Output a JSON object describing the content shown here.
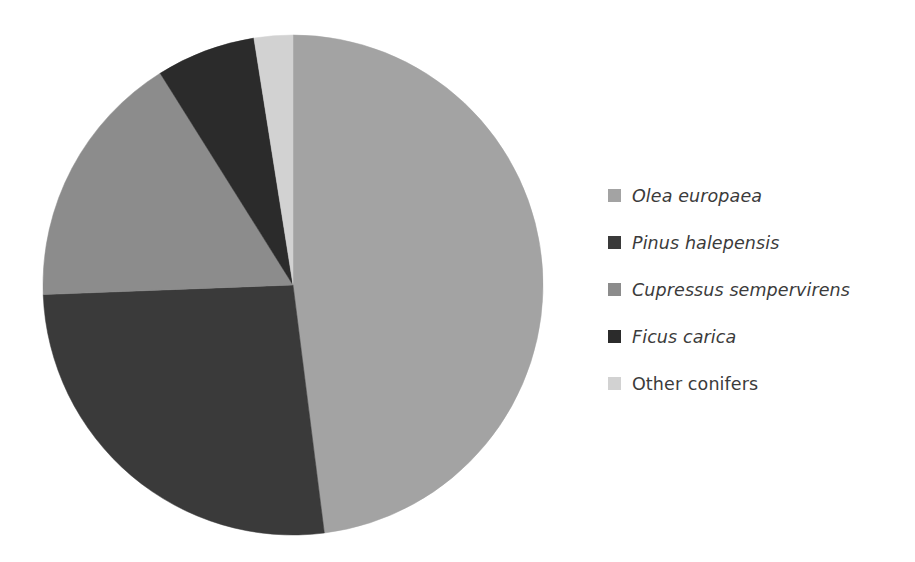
{
  "chart_data": {
    "type": "pie",
    "title": "",
    "subtitle": "",
    "xlabel": "",
    "ylabel": "",
    "grid": false,
    "legend_position": "right",
    "start_angle_deg": 0,
    "direction": "clockwise",
    "categories": [
      "Olea europaea",
      "Pinus halepensis",
      "Cupressus sempervirens",
      "Ficus carica",
      "Other conifers"
    ],
    "values": [
      48.0,
      26.4,
      16.7,
      6.4,
      2.5
    ],
    "unit": "%",
    "colors": [
      "#a3a3a3",
      "#3a3a3a",
      "#8c8c8c",
      "#2b2b2b",
      "#d2d2d2"
    ],
    "slices": [
      {
        "label": "Olea europaea",
        "value": 48.0,
        "color": "#a3a3a3",
        "start_angle_deg": 0,
        "end_angle_deg": 172.8,
        "italic": true
      },
      {
        "label": "Pinus halepensis",
        "value": 26.4,
        "color": "#3a3a3a",
        "start_angle_deg": 172.8,
        "end_angle_deg": 267.8,
        "italic": true
      },
      {
        "label": "Cupressus sempervirens",
        "value": 16.7,
        "color": "#8c8c8c",
        "start_angle_deg": 267.8,
        "end_angle_deg": 327.9,
        "italic": true
      },
      {
        "label": "Ficus carica",
        "value": 6.4,
        "color": "#2b2b2b",
        "start_angle_deg": 327.9,
        "end_angle_deg": 351.0,
        "italic": true
      },
      {
        "label": "Other conifers",
        "value": 2.5,
        "color": "#d2d2d2",
        "start_angle_deg": 351.0,
        "end_angle_deg": 360.0,
        "italic": false
      }
    ],
    "geometry": {
      "center_x": 293,
      "center_y": 285,
      "radius": 250
    }
  },
  "legend": {
    "items": [
      {
        "label": "Olea europaea",
        "color": "#a3a3a3",
        "swatch_name": "legend-swatch-olea-europaea"
      },
      {
        "label": "Pinus halepensis",
        "color": "#3a3a3a",
        "swatch_name": "legend-swatch-pinus-halepensis"
      },
      {
        "label": "Cupressus sempervirens",
        "color": "#8c8c8c",
        "swatch_name": "legend-swatch-cupressus-sempervirens"
      },
      {
        "label": "Ficus carica",
        "color": "#2b2b2b",
        "swatch_name": "legend-swatch-ficus-carica"
      },
      {
        "label": "Other conifers",
        "color": "#d2d2d2",
        "swatch_name": "legend-swatch-other-conifers"
      }
    ]
  }
}
